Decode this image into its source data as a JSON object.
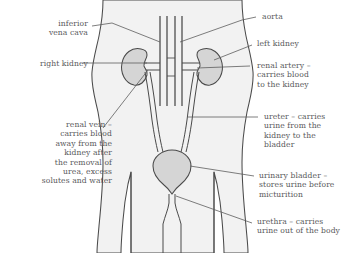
{
  "figure": {
    "caption_fragment": "",
    "colors": {
      "body_fill": "#f2f2f2",
      "organ_fill": "#d5d5d5",
      "outline": "#4a4a4a",
      "text": "#58585a",
      "leader_line": "#5d5d5d",
      "background": "#ffffff"
    }
  },
  "labels": {
    "left": [
      {
        "id": "inferior-vena-cava",
        "text": "inferior\nvena cava"
      },
      {
        "id": "right-kidney",
        "text": "right kidney"
      },
      {
        "id": "renal-vein",
        "text": "renal vein –\ncarries blood\naway from the\nkidney after\nthe removal of\nurea, excess\nsolutes and water"
      }
    ],
    "right": [
      {
        "id": "aorta",
        "text": "aorta"
      },
      {
        "id": "left-kidney",
        "text": "left kidney"
      },
      {
        "id": "renal-artery",
        "text": "renal artery –\ncarries blood\nto the kidney"
      },
      {
        "id": "ureter",
        "text": "ureter – carries\nurine from the\nkidney to the\nbladder"
      },
      {
        "id": "urinary-bladder",
        "text": "urinary bladder –\nstores urine before\nmicturition"
      },
      {
        "id": "urethra",
        "text": "urethra – carries\nurine out of the body"
      }
    ]
  },
  "anatomy": {
    "parts": [
      "torso-outline",
      "right-kidney-shape",
      "left-kidney-shape",
      "inferior-vena-cava-vessel",
      "aorta-vessel",
      "renal-artery-vessel",
      "renal-vein-vessel",
      "right-ureter",
      "left-ureter",
      "urinary-bladder-shape",
      "urethra-shape"
    ]
  }
}
